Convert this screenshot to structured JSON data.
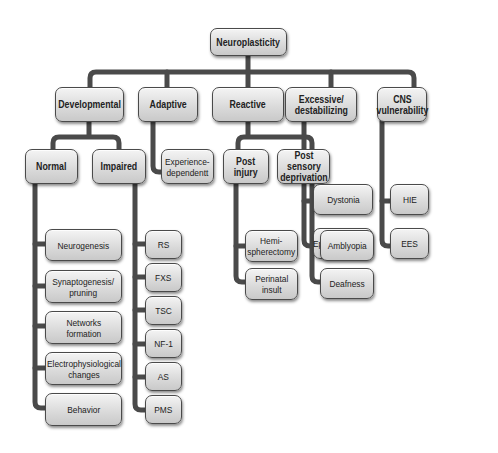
{
  "diagram": {
    "title": "Neuroplasticity",
    "colors": {
      "connector": "#4a4a4a",
      "box_fill_top": "#f4f4f4",
      "box_fill_bottom": "#c9c9c9",
      "box_border": "#4a4a4a",
      "text": "#222222",
      "background": "#ffffff"
    },
    "root": "Neuroplasticity",
    "categories": [
      {
        "label": "Developmental",
        "children": [
          {
            "label": "Normal",
            "children": [
              "Neurogenesis",
              "Synaptogenesis/\npruning",
              "Networks\nformation",
              "Electrophysiological\nchanges",
              "Behavior"
            ]
          },
          {
            "label": "Impaired",
            "children": [
              "RS",
              "FXS",
              "TSC",
              "NF-1",
              "AS",
              "PMS"
            ]
          }
        ]
      },
      {
        "label": "Adaptive",
        "children": [
          "Experience-\ndependentt"
        ]
      },
      {
        "label": "Reactive",
        "children": [
          {
            "label": "Post\ninjury",
            "children": [
              "Hemi-\nspherectomy",
              "Perinatal\ninsult"
            ]
          },
          {
            "label": "Post sensory\ndeprivation",
            "children": [
              "Amblyopia",
              "Deafness"
            ]
          }
        ]
      },
      {
        "label": "Excessive/\ndestabilizing",
        "children": [
          "Dystonia",
          "Epileptogenesis"
        ]
      },
      {
        "label": "CNS\nvulnerability",
        "children": [
          "HIE",
          "EES"
        ]
      }
    ]
  },
  "nodes": {
    "root": "Neuroplasticity",
    "developmental": "Developmental",
    "adaptive": "Adaptive",
    "reactive": "Reactive",
    "excessive": "Excessive/\ndestabilizing",
    "cns": "CNS\nvulnerability",
    "normal": "Normal",
    "impaired": "Impaired",
    "experience": "Experience-\ndependentt",
    "post_injury": "Post\ninjury",
    "post_sensory": "Post sensory\ndeprivation",
    "dystonia": "Dystonia",
    "epileptogenesis": "Epileptogenesis",
    "hie": "HIE",
    "ees": "EES",
    "neurogenesis": "Neurogenesis",
    "synaptogenesis": "Synaptogenesis/\npruning",
    "networks": "Networks\nformation",
    "electro": "Electrophysiological\nchanges",
    "behavior": "Behavior",
    "rs": "RS",
    "fxs": "FXS",
    "tsc": "TSC",
    "nf1": "NF-1",
    "as": "AS",
    "pms": "PMS",
    "hemi": "Hemi-\nspherectomy",
    "perinatal": "Perinatal\ninsult",
    "amblyopia": "Amblyopia",
    "deafness": "Deafness"
  }
}
